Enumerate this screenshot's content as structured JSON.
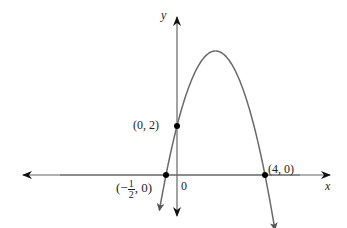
{
  "chart_data": {
    "type": "line",
    "title": "",
    "xlabel": "x",
    "ylabel": "y",
    "function": "y = -(x + 1/2)(x - 4) = -x^2 + 3.5x + 2",
    "origin_label": "0",
    "points": [
      {
        "x": -0.5,
        "y": 0,
        "label_prefix": "(−",
        "label_num": "1",
        "label_den": "2",
        "label_suffix": ", 0)"
      },
      {
        "x": 0,
        "y": 2,
        "label": "(0, 2)"
      },
      {
        "x": 4,
        "y": 0,
        "label": "(4, 0)"
      }
    ],
    "vertex": {
      "x": 1.75,
      "y": 5.0625
    },
    "grid": false,
    "curve_color": "#666666",
    "axis_color": "#555555",
    "point_color": "#000000"
  }
}
